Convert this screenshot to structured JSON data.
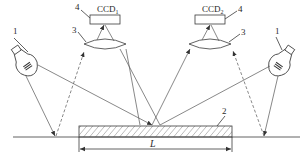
{
  "diagram": {
    "type": "optical measurement schematic",
    "labels": {
      "lamp_left": "1",
      "lamp_right": "1",
      "workpiece": "2",
      "lens_left": "3",
      "lens_right": "3",
      "ccd_left_callout": "4",
      "ccd_right_callout": "4",
      "ccd_left_name": "CCD",
      "ccd_left_sub": "1",
      "ccd_right_name": "CCD",
      "ccd_right_sub": "2",
      "length": "L"
    },
    "components": [
      {
        "id": "1",
        "name": "light source (lamp)",
        "count": 2
      },
      {
        "id": "2",
        "name": "measured workpiece (hatched plate)"
      },
      {
        "id": "3",
        "name": "lens",
        "count": 2
      },
      {
        "id": "4",
        "name": "CCD camera",
        "count": 2
      }
    ],
    "colors": {
      "line": "#3a3a3a",
      "ray": "#555555",
      "background": "#ffffff"
    }
  }
}
